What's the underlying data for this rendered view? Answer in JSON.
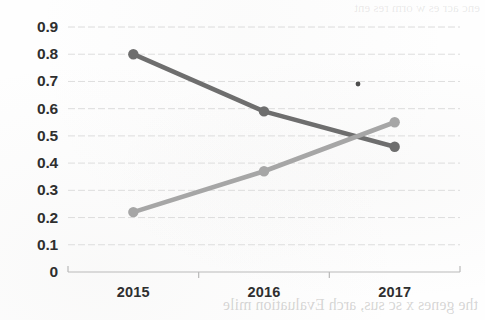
{
  "chart_data": {
    "type": "line",
    "title": "",
    "subtitle": "",
    "xlabel": "",
    "ylabel": "",
    "categories": [
      "2015",
      "2016",
      "2017"
    ],
    "series": [
      {
        "name": "series-declining",
        "color": "#6e6e6e",
        "values": [
          0.8,
          0.59,
          0.46
        ]
      },
      {
        "name": "series-rising",
        "color": "#a6a6a6",
        "values": [
          0.22,
          0.37,
          0.55
        ]
      }
    ],
    "ylim": [
      0,
      0.9
    ],
    "ytick_step": 0.1,
    "ytick_labels": [
      "0.9",
      "0.8",
      "0.7",
      "0.6",
      "0.5",
      "0.4",
      "0.3",
      "0.2",
      "0.1",
      "0"
    ],
    "ytick_values": [
      0.9,
      0.8,
      0.7,
      0.6,
      0.5,
      0.4,
      0.3,
      0.2,
      0.1,
      0
    ],
    "xtick_labels": [
      "2015",
      "2016",
      "2017"
    ],
    "grid": true,
    "grid_axis": "y",
    "grid_color": "#d8d8d8",
    "legend": false,
    "legend_position": "none",
    "marker": "circle",
    "annotations": [
      {
        "name": "stray-dot",
        "x_px": 358,
        "y_px": 84,
        "value": 0.7
      }
    ]
  },
  "artifacts": {
    "bleed_through_text": "the genes x sc sus, arch Evaluation mile",
    "bleed_through_text_top": "enc acr es w orm res ent"
  },
  "colors": {
    "background": "#fefefe",
    "axis": "#b9b9b9",
    "grid": "#d8d8d8",
    "tick_text": "#2f2f2f",
    "series_declining": "#6e6e6e",
    "series_rising": "#a6a6a6"
  }
}
